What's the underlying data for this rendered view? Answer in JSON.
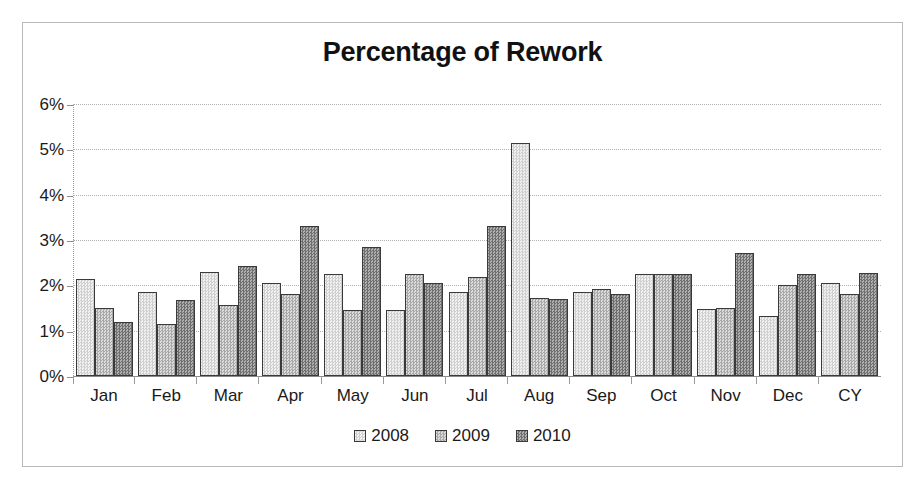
{
  "chart_data": {
    "type": "bar",
    "title": "Percentage of Rework",
    "xlabel": "",
    "ylabel": "",
    "ylim": [
      0,
      6
    ],
    "ytick_values": [
      0,
      1,
      2,
      3,
      4,
      5,
      6
    ],
    "ytick_labels": [
      "0%",
      "1%",
      "2%",
      "3%",
      "4%",
      "5%",
      "6%"
    ],
    "grid": true,
    "legend_position": "bottom",
    "value_unit": "%",
    "categories": [
      "Jan",
      "Feb",
      "Mar",
      "Apr",
      "May",
      "Jun",
      "Jul",
      "Aug",
      "Sep",
      "Oct",
      "Nov",
      "Dec",
      "CY"
    ],
    "series": [
      {
        "name": "2008",
        "color": "#e2e2e2",
        "values": [
          2.15,
          1.85,
          2.3,
          2.05,
          2.25,
          1.45,
          1.85,
          5.15,
          1.85,
          2.25,
          1.47,
          1.32,
          2.05
        ]
      },
      {
        "name": "2009",
        "color": "#c2c2c2",
        "values": [
          1.5,
          1.15,
          1.57,
          1.8,
          1.45,
          2.25,
          2.18,
          1.72,
          1.92,
          2.25,
          1.5,
          2.0,
          1.8
        ]
      },
      {
        "name": "2010",
        "color": "#8f8f8f",
        "values": [
          1.2,
          1.67,
          2.42,
          3.3,
          2.85,
          2.05,
          3.3,
          1.7,
          1.8,
          2.25,
          2.72,
          2.25,
          2.27
        ]
      }
    ]
  }
}
